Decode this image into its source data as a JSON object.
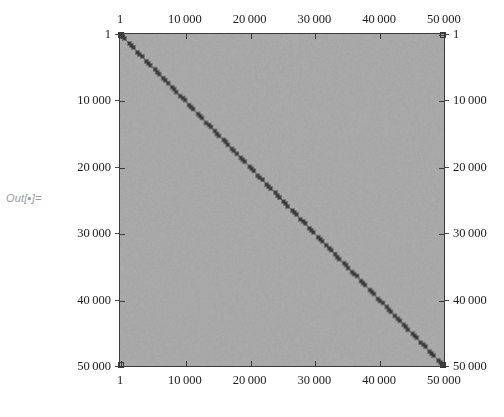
{
  "cell": {
    "out_label": "Out[▪]="
  },
  "plot": {
    "background_color": "#a9a9a9",
    "diagonal_color": "#3a3a3a",
    "frame_color": "#3a3a3a",
    "frame": {
      "left": 119,
      "top": 33,
      "width": 326,
      "height": 334
    }
  },
  "chart_data": {
    "type": "heatmap",
    "title": "",
    "subtitle": "",
    "xlabel": "",
    "ylabel": "",
    "matrix_size": [
      50000,
      50000
    ],
    "xlim": [
      1,
      50000
    ],
    "ylim": [
      1,
      50000
    ],
    "y_axis_direction": "reversed",
    "grid": false,
    "legend": "none",
    "nonzero_pattern": "main-diagonal",
    "nonzero_count": 50000,
    "diagonal_points": [
      [
        1,
        1
      ],
      [
        10000,
        10000
      ],
      [
        20000,
        20000
      ],
      [
        30000,
        30000
      ],
      [
        40000,
        40000
      ],
      [
        50000,
        50000
      ]
    ],
    "axes": {
      "top": {
        "ticks": [
          1,
          10000,
          20000,
          30000,
          40000,
          50000
        ],
        "tick_labels": [
          "1",
          "10 000",
          "20 000",
          "30 000",
          "40 000",
          "50 000"
        ]
      },
      "bottom": {
        "ticks": [
          1,
          10000,
          20000,
          30000,
          40000,
          50000
        ],
        "tick_labels": [
          "1",
          "10 000",
          "20 000",
          "30 000",
          "40 000",
          "50 000"
        ]
      },
      "left": {
        "ticks": [
          1,
          10000,
          20000,
          30000,
          40000,
          50000
        ],
        "tick_labels": [
          "1",
          "10 000",
          "20 000",
          "30 000",
          "40 000",
          "50 000"
        ]
      },
      "right": {
        "ticks": [
          1,
          10000,
          20000,
          30000,
          40000,
          50000
        ],
        "tick_labels": [
          "1",
          "10 000",
          "20 000",
          "30 000",
          "40 000",
          "50 000"
        ]
      }
    }
  }
}
